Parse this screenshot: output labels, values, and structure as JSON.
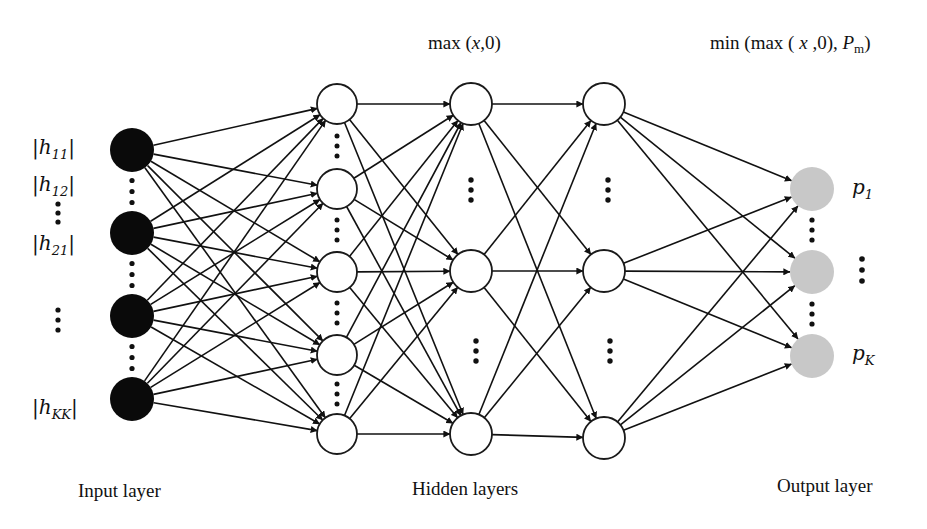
{
  "diagram": {
    "type": "fully-connected neural network",
    "colors": {
      "input_node": "#0a0a0a",
      "hidden_node_fill": "#ffffff",
      "hidden_node_stroke": "#1a1a1a",
      "output_node": "#c8c8c8",
      "edge": "#111111"
    },
    "layers": [
      {
        "id": "input",
        "caption": "Input layer",
        "node_count_drawn": 4
      },
      {
        "id": "hidden1",
        "node_count_drawn": 5
      },
      {
        "id": "hidden2",
        "node_count_drawn": 3
      },
      {
        "id": "hidden3",
        "node_count_drawn": 3
      },
      {
        "id": "output",
        "caption": "Output layer",
        "node_count_drawn": 3
      }
    ],
    "captions": {
      "input": "Input layer",
      "hidden": "Hidden layers",
      "output": "Output layer"
    },
    "activations": {
      "hidden": {
        "prefix": "max (",
        "var": "x",
        "suffix": ",0)"
      },
      "output": {
        "prefix": "min (max ( ",
        "var": "x",
        "mid": " ,0), ",
        "var2": "P",
        "sub2": "m",
        "suffix": ")"
      }
    },
    "input_labels": [
      {
        "base": "h",
        "sub": "11"
      },
      {
        "base": "h",
        "sub": "12"
      },
      {
        "base": "h",
        "sub": "21"
      },
      {
        "base": "h",
        "sub": "KK"
      }
    ],
    "output_labels": [
      {
        "base": "p",
        "sub": "1"
      },
      {
        "base": "p",
        "sub": "K"
      }
    ],
    "ellipsis": "⋮"
  }
}
